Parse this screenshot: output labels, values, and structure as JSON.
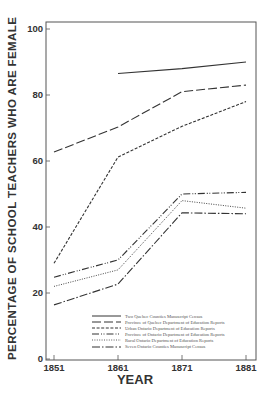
{
  "chart_data": {
    "type": "line",
    "title": "",
    "xlabel": "YEAR",
    "ylabel": "PERCENTAGE OF SCHOOL TEACHERS WHO ARE FEMALE",
    "x": [
      1851,
      1861,
      1871,
      1881
    ],
    "x_tick_labels": [
      "1851",
      "1861",
      "1871",
      "1881"
    ],
    "y_tick_labels": [
      "0",
      "20",
      "40",
      "60",
      "80",
      "100"
    ],
    "ylim": [
      0,
      100
    ],
    "grid": false,
    "legend_position": "lower right (inside plot)",
    "series": [
      {
        "name": "Two Quebec Counties   Manuscript Census",
        "style": "solid",
        "values": [
          null,
          86.5,
          88,
          90
        ]
      },
      {
        "name": "Province of Quebec   Department of Education Reports",
        "style": "long-dash",
        "values": [
          62.7,
          70.3,
          81,
          83
        ]
      },
      {
        "name": "Urban Ontario   Department of Education Reports",
        "style": "short-dash",
        "values": [
          29,
          61.2,
          70.5,
          78
        ]
      },
      {
        "name": "Province of Ontario   Department of Education Reports",
        "style": "dash-dot-dot",
        "values": [
          24.8,
          30,
          50,
          50.5
        ]
      },
      {
        "name": "Rural Ontario   Department of Education Reports",
        "style": "dotted",
        "values": [
          22,
          27,
          48,
          45.7
        ]
      },
      {
        "name": "Seven Ontario Counties   Manuscript Census",
        "style": "dash-dot",
        "values": [
          16.4,
          22.7,
          44.3,
          44
        ]
      }
    ]
  }
}
